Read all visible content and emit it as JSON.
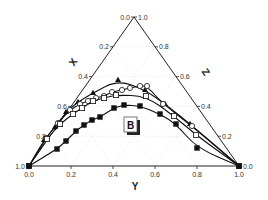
{
  "chart_data": {
    "type": "scatter",
    "subtype": "ternary",
    "title": "",
    "panel_label": "B",
    "axes": {
      "left": {
        "label": "X",
        "ticks": [
          "0.0",
          "0.2",
          "0.4",
          "0.6",
          "0.8",
          "1.0"
        ]
      },
      "right": {
        "label": "Z",
        "ticks": [
          "1.0",
          "0.8",
          "0.6",
          "0.4",
          "0.2",
          "0.0"
        ]
      },
      "bottom": {
        "label": "Y",
        "ticks": [
          "0.0",
          "0.2",
          "0.4",
          "0.6",
          "0.8",
          "1.0"
        ]
      }
    },
    "grid": true,
    "legend": null,
    "series": [
      {
        "name": "filled-triangle",
        "marker": "triangle-filled",
        "points_xy_screen": [
          [
            29,
            166
          ],
          [
            44,
            140
          ],
          [
            55,
            127
          ],
          [
            66,
            112
          ],
          [
            78,
            102
          ],
          [
            93,
            93
          ],
          [
            118,
            80
          ],
          [
            145,
            90
          ],
          [
            165,
            104
          ],
          [
            190,
            124
          ],
          [
            239,
            166
          ]
        ]
      },
      {
        "name": "open-circle",
        "marker": "circle-open",
        "points_xy_screen": [
          [
            29,
            166
          ],
          [
            46,
            138
          ],
          [
            58,
            123
          ],
          [
            70,
            110
          ],
          [
            80,
            104
          ],
          [
            88,
            101
          ],
          [
            96,
            98
          ],
          [
            104,
            96
          ],
          [
            112,
            92
          ],
          [
            122,
            90
          ],
          [
            130,
            88
          ],
          [
            140,
            86
          ],
          [
            147,
            86
          ],
          [
            163,
            104
          ],
          [
            192,
            126
          ],
          [
            239,
            166
          ]
        ]
      },
      {
        "name": "open-square",
        "marker": "square-open",
        "points_xy_screen": [
          [
            29,
            166
          ],
          [
            47,
            139
          ],
          [
            60,
            124
          ],
          [
            73,
            114
          ],
          [
            82,
            108
          ],
          [
            93,
            101
          ],
          [
            104,
            98
          ],
          [
            116,
            95
          ],
          [
            146,
            96
          ],
          [
            174,
            116
          ],
          [
            196,
            135
          ],
          [
            239,
            166
          ]
        ]
      },
      {
        "name": "filled-square",
        "marker": "square-filled",
        "points_xy_screen": [
          [
            29,
            166
          ],
          [
            57,
            149
          ],
          [
            66,
            141
          ],
          [
            76,
            131
          ],
          [
            84,
            125
          ],
          [
            92,
            120
          ],
          [
            100,
            117
          ],
          [
            114,
            108
          ],
          [
            124,
            105
          ],
          [
            140,
            106
          ],
          [
            160,
            114
          ],
          [
            176,
            124
          ],
          [
            197,
            148
          ],
          [
            239,
            166
          ]
        ]
      }
    ]
  }
}
